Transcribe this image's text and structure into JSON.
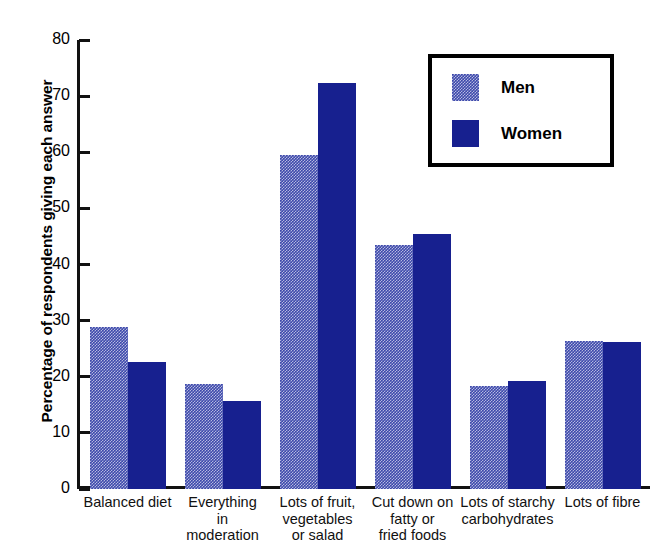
{
  "chart_data": {
    "type": "bar",
    "title": "",
    "xlabel": "",
    "ylabel": "Percentage of respondents giving each answer",
    "ylim": [
      0,
      80
    ],
    "yticks": [
      0,
      10,
      20,
      30,
      40,
      50,
      60,
      70,
      80
    ],
    "ytick_labels": [
      "0",
      "10",
      "20",
      "30",
      "40",
      "50",
      "60",
      "70",
      "80"
    ],
    "grid": false,
    "legend_position": "top-right",
    "categories": [
      "Balanced diet",
      "Everything in moderation",
      "Lots of fruit, vegetables or salad",
      "Cut down on fatty or fried foods",
      "Lots of starchy carbohydrates",
      "Lots of fibre"
    ],
    "category_lines": [
      [
        "Balanced diet"
      ],
      [
        "Everything",
        "in",
        "moderation"
      ],
      [
        "Lots of fruit,",
        "vegetables",
        "or salad"
      ],
      [
        "Cut down on",
        "fatty or",
        "fried foods"
      ],
      [
        "Lots of starchy",
        "carbohydrates"
      ],
      [
        "Lots of fibre"
      ]
    ],
    "series": [
      {
        "name": "Men",
        "color": "#3d49ab",
        "fill": "dither-checker",
        "values": [
          28.8,
          18.7,
          59.6,
          43.4,
          18.4,
          26.4
        ]
      },
      {
        "name": "Women",
        "color": "#17208f",
        "fill": "solid",
        "values": [
          22.6,
          15.6,
          72.4,
          45.5,
          19.3,
          26.2
        ]
      }
    ]
  },
  "legend": {
    "items": [
      {
        "label": "Men"
      },
      {
        "label": "Women"
      }
    ]
  },
  "colors": {
    "men": "#3d49ab",
    "women": "#17208f",
    "axis": "#111111",
    "background": "#ffffff"
  }
}
